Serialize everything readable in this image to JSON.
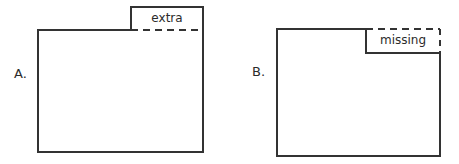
{
  "figures": [
    {
      "key": "A",
      "label": "A.",
      "region_label": "extra",
      "description": "rectangle with an extra rectangular piece attached on top right",
      "outline_color": "#333333",
      "fill_color": "#ffffff",
      "dashed_edge": "bottom of extra piece",
      "body_rect": {
        "x": 38,
        "y": 30,
        "width": 165,
        "height": 122
      },
      "piece_rect": {
        "x": 131,
        "y": 7,
        "width": 72,
        "height": 23
      }
    },
    {
      "key": "B",
      "label": "B.",
      "region_label": "missing",
      "description": "rectangle with a rectangular piece missing from top right",
      "outline_color": "#333333",
      "fill_color": "#ffffff",
      "dashed_edge": "top and right of missing piece",
      "body_rect": {
        "x": 277,
        "y": 29,
        "width": 163,
        "height": 127
      },
      "piece_rect": {
        "x": 366,
        "y": 29,
        "width": 74,
        "height": 24
      }
    }
  ],
  "style": {
    "background": "#ffffff",
    "stroke": "#333333",
    "text_color": "#2b2b2b",
    "stroke_width": 2,
    "dash_pattern": "7 5"
  },
  "canvas": {
    "width": 459,
    "height": 164
  }
}
